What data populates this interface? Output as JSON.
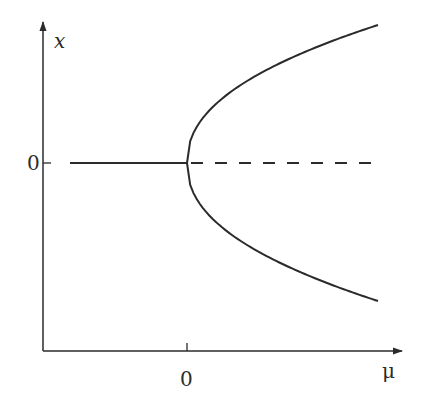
{
  "chart_data": {
    "type": "line",
    "xlabel": "μ",
    "ylabel": "x",
    "x_tick_labels": [
      "0"
    ],
    "y_tick_labels": [
      "0"
    ],
    "grid": false,
    "legend": null,
    "series": [
      {
        "name": "stable trivial branch (μ<0)",
        "style": "solid",
        "x": [
          -0.61,
          0
        ],
        "y": [
          0,
          0
        ]
      },
      {
        "name": "unstable trivial branch (μ>0)",
        "style": "dashed",
        "x": [
          0,
          1
        ],
        "y": [
          0,
          0
        ]
      },
      {
        "name": "upper stable branch x=+√μ",
        "style": "solid",
        "x": [
          0,
          0.25,
          0.5,
          0.75,
          1
        ],
        "y": [
          0,
          0.54,
          0.73,
          0.88,
          1
        ]
      },
      {
        "name": "lower stable branch x=−√μ",
        "style": "solid",
        "x": [
          0,
          0.25,
          0.5,
          0.75,
          1
        ],
        "y": [
          0,
          -0.54,
          -0.73,
          -0.88,
          -1
        ]
      }
    ]
  },
  "labels": {
    "y_axis": "x",
    "x_axis": "μ",
    "y_zero": "0",
    "x_zero": "0"
  },
  "colors": {
    "ink": "#2b2b2b",
    "background": "#ffffff"
  },
  "geometry": {
    "origin_px": [
      187,
      163
    ],
    "axis_corner_px": [
      43,
      351
    ],
    "branch_end_px": 378,
    "branch_half_height_px": 138,
    "exponent": 0.45
  }
}
